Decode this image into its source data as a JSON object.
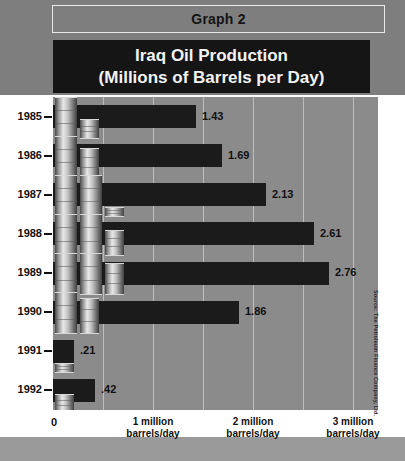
{
  "header": {
    "label": "Graph 2"
  },
  "title": {
    "line1": "Iraq Oil Production",
    "line2": "(Millions of Barrels per Day)"
  },
  "source": {
    "text": "Source: The Petroleum Finance Company, Ltd."
  },
  "axis": {
    "zero_label": "0",
    "ticks": [
      {
        "value": 1,
        "line1": "1 million",
        "line2": "barrels/day"
      },
      {
        "value": 2,
        "line1": "2 million",
        "line2": "barrels/day"
      },
      {
        "value": 3,
        "line1": "3 million",
        "line2": "barrels/day"
      }
    ]
  },
  "colors": {
    "page_background": "#7e7e7e",
    "panel": "#ffffff",
    "plot_background": "#8b8b8b",
    "bar": "#1b1b1b",
    "banner": "#151515",
    "gridline": "#cfcfcf",
    "text": "#101010"
  },
  "chart_data": {
    "type": "bar",
    "orientation": "horizontal",
    "title": "Iraq Oil Production (Millions of Barrels per Day)",
    "xlabel": "barrels/day",
    "ylabel": "",
    "xlim": [
      0,
      3.25
    ],
    "grid": true,
    "grid_interval": 0.5,
    "legend": "none",
    "categories": [
      "1985",
      "1986",
      "1987",
      "1988",
      "1989",
      "1990",
      "1991",
      "1992"
    ],
    "values": [
      1.43,
      1.69,
      2.13,
      2.61,
      2.76,
      1.86,
      0.21,
      0.42
    ],
    "data_labels": [
      "1.43",
      "1.69",
      "2.13",
      "2.61",
      "2.76",
      "1.86",
      ".21",
      ".42"
    ]
  }
}
